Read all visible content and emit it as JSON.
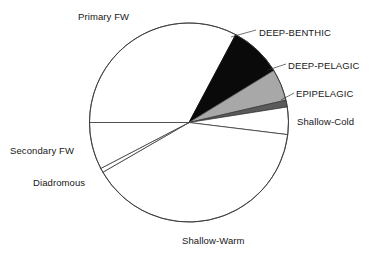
{
  "chart_data": {
    "type": "pie",
    "title": "",
    "subtitle": "",
    "xlabel": "",
    "ylabel": "",
    "grid": false,
    "legend_position": "none",
    "label_placement": "outside-with-leader",
    "center": {
      "x": 189,
      "y": 122.5
    },
    "radius": 99.5,
    "start_angle_deg": 180,
    "direction": "clockwise",
    "total_percent": 100,
    "categories": [
      "Primary FW",
      "DEEP-BENTHIC",
      "DEEP-PELAGIC",
      "EPIPELAGIC",
      "Shallow-Cold",
      "Shallow-Warm",
      "Diadromous",
      "Secondary FW"
    ],
    "values": [
      32.8,
      8.5,
      5.1,
      1.1,
      4.4,
      39.7,
      0.7,
      7.7
    ],
    "slices": [
      {
        "label": "Primary FW",
        "value": 32.8,
        "angle_deg": 118.0,
        "start_deg": 180.0,
        "end_deg": 62.0,
        "fill": "#ffffff",
        "stroke": "#3a3a3a"
      },
      {
        "label": "DEEP-BENTHIC",
        "value": 8.5,
        "angle_deg": 30.5,
        "start_deg": 62.0,
        "end_deg": 31.5,
        "fill": "#0a0a0a",
        "stroke": "#0a0a0a"
      },
      {
        "label": "DEEP-PELAGIC",
        "value": 5.1,
        "angle_deg": 18.5,
        "start_deg": 31.5,
        "end_deg": 13.0,
        "fill": "#a8a8a8",
        "stroke": "#555555"
      },
      {
        "label": "EPIPELAGIC",
        "value": 1.1,
        "angle_deg": 4.0,
        "start_deg": 13.0,
        "end_deg": 9.0,
        "fill": "#5a5a5a",
        "stroke": "#3a3a3a"
      },
      {
        "label": "Shallow-Cold",
        "value": 4.4,
        "angle_deg": 16.0,
        "start_deg": 9.0,
        "end_deg": -7.0,
        "fill": "#ffffff",
        "stroke": "#3a3a3a"
      },
      {
        "label": "Shallow-Warm",
        "value": 39.7,
        "angle_deg": 143.0,
        "start_deg": -7.0,
        "end_deg": -150.0,
        "fill": "#ffffff",
        "stroke": "#3a3a3a"
      },
      {
        "label": "Diadromous",
        "value": 0.7,
        "angle_deg": 2.5,
        "start_deg": -150.0,
        "end_deg": -152.5,
        "fill": "#ffffff",
        "stroke": "#3a3a3a"
      },
      {
        "label": "Secondary FW",
        "value": 7.7,
        "angle_deg": 27.5,
        "start_deg": -152.5,
        "end_deg": -180.0,
        "fill": "#ffffff",
        "stroke": "#3a3a3a"
      }
    ],
    "colors": {
      "background": "#ffffff",
      "outline": "#3a3a3a",
      "text": "#171717",
      "deep_benthic": "#0a0a0a",
      "deep_pelagic": "#a8a8a8",
      "epipelagic": "#5a5a5a",
      "white_slice": "#ffffff"
    }
  },
  "labels": {
    "primary_fw": "Primary FW",
    "deep_benthic": "DEEP-BENTHIC",
    "deep_pelagic": "DEEP-PELAGIC",
    "epipelagic": "EPIPELAGIC",
    "shallow_cold": "Shallow-Cold",
    "secondary_fw": "Secondary FW",
    "diadromous": "Diadromous",
    "shallow_warm": "Shallow-Warm"
  }
}
